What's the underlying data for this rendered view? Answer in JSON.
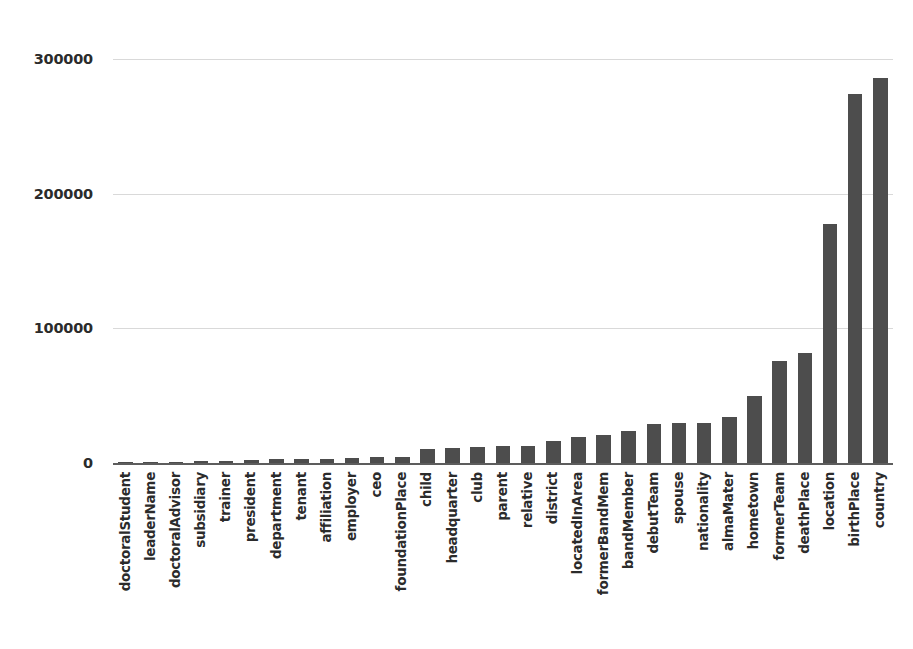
{
  "chart_data": {
    "type": "bar",
    "title": "",
    "subtitle": "",
    "xlabel": "",
    "ylabel": "",
    "ylim": [
      0,
      310000
    ],
    "grid": true,
    "legend": null,
    "legend_position": "none",
    "bar_color": "#4d4d4d",
    "gridline_color": "#d9d9d9",
    "axis_color": "#5d5d5d",
    "yticks": [
      0,
      100000,
      200000,
      300000
    ],
    "ytick_labels": [
      "0",
      "100000",
      "200000",
      "300000"
    ],
    "categories": [
      "doctoralStudent",
      "leaderName",
      "doctoralAdvisor",
      "subsidiary",
      "trainer",
      "president",
      "department",
      "tenant",
      "affiliation",
      "employer",
      "ceo",
      "foundationPlace",
      "child",
      "headquarter",
      "club",
      "parent",
      "relative",
      "district",
      "locatedInArea",
      "formerBandMem",
      "bandMember",
      "debutTeam",
      "spouse",
      "nationality",
      "almaMater",
      "hometown",
      "formerTeam",
      "deathPlace",
      "location",
      "birthPlace",
      "country"
    ],
    "values": [
      300,
      600,
      900,
      1200,
      1800,
      2400,
      2700,
      3000,
      3300,
      3600,
      4200,
      4800,
      10500,
      11500,
      12000,
      12500,
      13000,
      16000,
      19000,
      21000,
      23500,
      29000,
      30000,
      30000,
      34500,
      50000,
      76000,
      82000,
      178000,
      274000,
      286000
    ]
  }
}
